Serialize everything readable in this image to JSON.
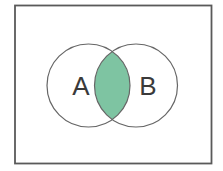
{
  "diagram": {
    "type": "venn-diagram",
    "set_a_label": "A",
    "set_b_label": "B",
    "shaded_region": "intersection of A and B"
  },
  "colors": {
    "background": "#ffffff",
    "frame_border": "#5a5a5a",
    "circle_stroke": "#666666",
    "intersection_fill": "#7EC4A2",
    "label_color": "#3a3a3a"
  }
}
